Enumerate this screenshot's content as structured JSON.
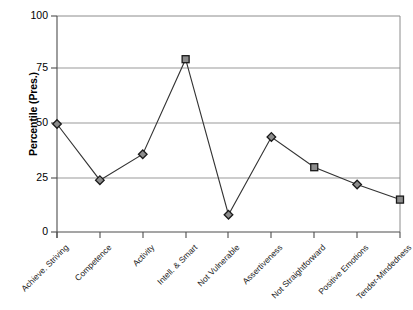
{
  "chart_data": {
    "type": "line",
    "title": "",
    "xlabel": "",
    "ylabel": "Percentile (Pres.)",
    "ylim": [
      0,
      100
    ],
    "yticks": [
      0,
      25,
      50,
      75,
      100
    ],
    "grid": true,
    "legend": "none",
    "categories": [
      "Achieve. Striving",
      "Competence",
      "Activity",
      "Intell. & Smart",
      "Not Vulnerable",
      "Assertiveness",
      "Not Straightforward",
      "Positive Emotions",
      "Tender-Mindedness"
    ],
    "values": [
      50,
      24,
      36,
      80,
      8,
      44,
      30,
      22,
      15
    ],
    "marker_shapes": [
      "diamond",
      "diamond",
      "diamond",
      "square",
      "diamond",
      "diamond",
      "square",
      "diamond",
      "square"
    ],
    "series": [
      {
        "name": "Percentile (Pres.)",
        "values": [
          50,
          24,
          36,
          80,
          8,
          44,
          30,
          22,
          15
        ]
      }
    ],
    "colors": {
      "line": "#333333",
      "marker_fill": "#8c8c8c",
      "marker_stroke": "#1a1a1a",
      "gridline": "#999999",
      "axis": "#4d4d4d",
      "plot_border": "#808080",
      "text": "#000000"
    }
  },
  "axis": {
    "y_title": "Percentile (Pres.)",
    "y_labels": [
      "100",
      "75",
      "50",
      "25",
      "0"
    ],
    "x_labels": [
      "Achieve. Striving",
      "Competence",
      "Activity",
      "Intell. & Smart",
      "Not Vulnerable",
      "Assertiveness",
      "Not Straightforward",
      "Positive Emotions",
      "Tender-Mindedness"
    ]
  }
}
